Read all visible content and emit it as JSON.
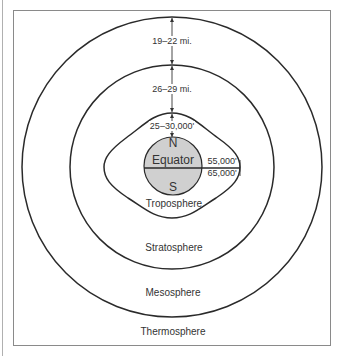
{
  "diagram": {
    "layers": [
      {
        "name": "Troposphere"
      },
      {
        "name": "Stratosphere"
      },
      {
        "name": "Mesosphere"
      },
      {
        "name": "Thermosphere"
      }
    ],
    "earth": {
      "north_label": "N",
      "south_label": "S",
      "equator_label": "Equator",
      "fill_color": "#d0d0d0"
    },
    "measurements": {
      "troposphere_height_poles": "25–30,000'",
      "troposphere_height_equator_top": "55,000'",
      "troposphere_height_equator_bottom": "65,000'",
      "stratosphere_thickness": "26–29 mi.",
      "mesosphere_thickness": "19–22 mi."
    }
  }
}
